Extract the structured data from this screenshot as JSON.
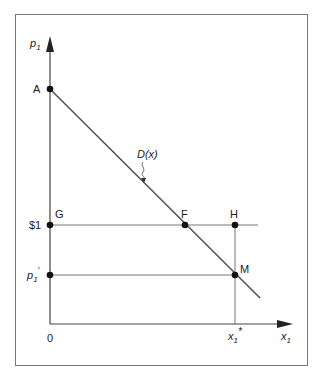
{
  "diagram": {
    "y_axis_label": "p",
    "y_axis_sub": "1",
    "x_axis_label": "x",
    "x_axis_sub": "1",
    "origin_label": "0",
    "curve_label": "D(x)",
    "points": {
      "A": "A",
      "G": "G",
      "F": "F",
      "H": "H",
      "M": "M"
    },
    "y_ticks": {
      "dollar_one": "$1",
      "p1_prime_main": "p",
      "p1_prime_sub": "1",
      "p1_prime_mark": "′"
    },
    "x_ticks": {
      "x1_star_main": "x",
      "x1_star_sub": "1",
      "x1_star_mark": "*"
    },
    "colors": {
      "line": "#555555",
      "axis": "#444444",
      "frame": "#777777",
      "point": "#111111"
    }
  }
}
